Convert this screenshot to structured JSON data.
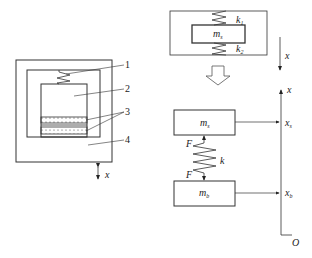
{
  "left_figure": {
    "callouts": [
      {
        "id": "1",
        "label": "1"
      },
      {
        "id": "2",
        "label": "2"
      },
      {
        "id": "3",
        "label": "3"
      },
      {
        "id": "4",
        "label": "4"
      }
    ],
    "axis_label": "x"
  },
  "top_right_figure": {
    "mass_label": "m",
    "mass_sub": "s",
    "spring_top_label": "k",
    "spring_top_sub": "1",
    "spring_bottom_label": "k",
    "spring_bottom_sub": "2",
    "axis_label": "x"
  },
  "bottom_right_figure": {
    "upper_mass_label": "m",
    "upper_mass_sub": "s",
    "lower_mass_label": "m",
    "lower_mass_sub": "b",
    "spring_label": "k",
    "force_top_label": "F",
    "force_bottom_label": "F",
    "axis_label": "x",
    "upper_pos_label": "x",
    "upper_pos_sub": "s",
    "lower_pos_label": "x",
    "lower_pos_sub": "b",
    "origin_label": "O"
  }
}
